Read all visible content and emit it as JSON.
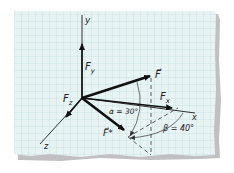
{
  "figure": {
    "colors": {
      "paper": "#e8f3f4",
      "grid": "#b9d6da",
      "ink": "#1a1a1a",
      "shadow": "#9a9a9a"
    },
    "axes": {
      "x_label": "x",
      "y_label": "y",
      "z_label": "z"
    },
    "vectors": {
      "F": "F⃗",
      "Fx": "F",
      "Fx_sub": "x",
      "Fy": "F",
      "Fy_sub": "y",
      "Fz": "F",
      "Fz_sub": "z",
      "Fstar": "F⃗*"
    },
    "angles": {
      "alpha": "α = 30°",
      "beta": "β = 40°"
    }
  }
}
